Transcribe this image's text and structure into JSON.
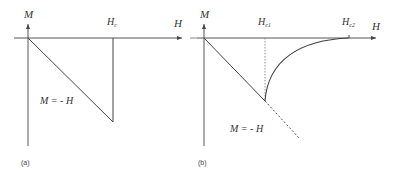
{
  "panels": [
    {
      "caption": "(a)",
      "y_axis_label": "M",
      "x_axis_label": "H",
      "critical_label": "Hc",
      "critical_base": "H",
      "critical_sub": "c",
      "line_label": "M = - H"
    },
    {
      "caption": "(b)",
      "y_axis_label": "M",
      "x_axis_label": "H",
      "critical1_base": "H",
      "critical1_sub": "c1",
      "critical2_base": "H",
      "critical2_sub": "c2",
      "line_label": "M = - H"
    }
  ]
}
